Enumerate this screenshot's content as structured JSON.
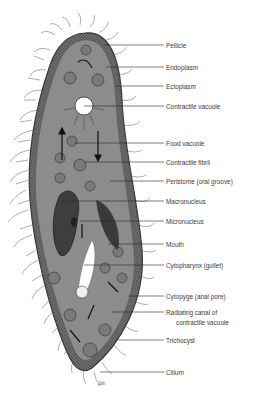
{
  "colors": {
    "body_fill": "#8a8a8a",
    "body_dark": "#4a4a4a",
    "cilia": "#5a5a5a",
    "vacuole": "#ffffff",
    "leader_line": "#2a2a2a",
    "label_text": "#3a3a3a"
  },
  "labels": [
    {
      "text": "Pellicle",
      "y": 45
    },
    {
      "text": "Endoplasm",
      "y": 67
    },
    {
      "text": "Ectoplasm",
      "y": 86
    },
    {
      "text": "Contractile vacuole",
      "y": 106
    },
    {
      "text": "Food vacuole",
      "y": 143
    },
    {
      "text": "Contractile fibril",
      "y": 162
    },
    {
      "text": "Peristome (oral groove)",
      "y": 181
    },
    {
      "text": "Macronucleus",
      "y": 201
    },
    {
      "text": "Micronucleus",
      "y": 221
    },
    {
      "text": "Mouth",
      "y": 244
    },
    {
      "text": "Cytopharynx (gullet)",
      "y": 265
    },
    {
      "text": "Cytopyge (anal pore)",
      "y": 296
    },
    {
      "text": "Radiating canal of",
      "y": 312
    },
    {
      "text": "Trichocyst",
      "y": 340
    },
    {
      "text": "Cilium",
      "y": 372
    }
  ],
  "label_continuation": {
    "text": "contractile vacuole",
    "y": 322
  },
  "signature": "Jds"
}
